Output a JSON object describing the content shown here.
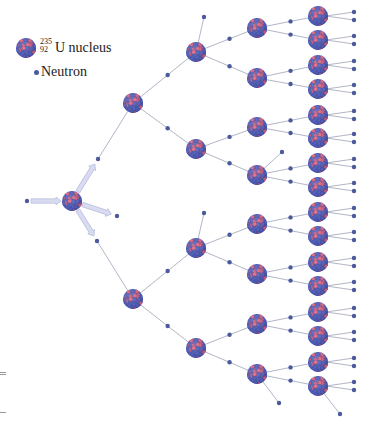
{
  "legend": {
    "nucleus_mass_number": "235",
    "nucleus_atomic_number": "92",
    "nucleus_label": "U nucleus",
    "neutron_label": "Neutron"
  },
  "colors": {
    "nucleus_red": "#e8607a",
    "nucleus_blue": "#4f5fc4",
    "neutron": "#4b5a9c",
    "link": "#9da3b8",
    "arrow_fill": "#d9dcf0",
    "arrow_stroke": "#a9afd6"
  },
  "diagram": {
    "nucleus_radius": 10,
    "neutron_radius": 2.2,
    "incoming_neutron": {
      "x": 27,
      "y": 201
    },
    "initial_nucleus": {
      "id": "N0",
      "x": 72,
      "y": 201
    },
    "initial_fission_neutrons": [
      {
        "x": 98,
        "y": 159
      },
      {
        "x": 117,
        "y": 216
      },
      {
        "x": 97,
        "y": 241
      }
    ],
    "nuclei": [
      {
        "id": "A1",
        "gen": 1,
        "x": 133,
        "y": 103
      },
      {
        "id": "A2",
        "gen": 1,
        "x": 133,
        "y": 299
      },
      {
        "id": "C1",
        "gen": 2,
        "x": 196,
        "y": 52
      },
      {
        "id": "C2",
        "gen": 2,
        "x": 196,
        "y": 149
      },
      {
        "id": "C3",
        "gen": 2,
        "x": 196,
        "y": 248
      },
      {
        "id": "C4",
        "gen": 2,
        "x": 196,
        "y": 348
      },
      {
        "id": "D1",
        "gen": 3,
        "x": 257,
        "y": 28
      },
      {
        "id": "D2",
        "gen": 3,
        "x": 257,
        "y": 78
      },
      {
        "id": "D3",
        "gen": 3,
        "x": 257,
        "y": 127
      },
      {
        "id": "D4",
        "gen": 3,
        "x": 257,
        "y": 175
      },
      {
        "id": "D5",
        "gen": 3,
        "x": 257,
        "y": 224
      },
      {
        "id": "D6",
        "gen": 3,
        "x": 257,
        "y": 274
      },
      {
        "id": "D7",
        "gen": 3,
        "x": 257,
        "y": 324
      },
      {
        "id": "D8",
        "gen": 3,
        "x": 257,
        "y": 374
      },
      {
        "id": "E1",
        "gen": 4,
        "x": 318,
        "y": 16
      },
      {
        "id": "E2",
        "gen": 4,
        "x": 318,
        "y": 40
      },
      {
        "id": "E3",
        "gen": 4,
        "x": 318,
        "y": 65
      },
      {
        "id": "E4",
        "gen": 4,
        "x": 318,
        "y": 89
      },
      {
        "id": "E5",
        "gen": 4,
        "x": 318,
        "y": 115
      },
      {
        "id": "E6",
        "gen": 4,
        "x": 318,
        "y": 138
      },
      {
        "id": "E7",
        "gen": 4,
        "x": 318,
        "y": 163
      },
      {
        "id": "E8",
        "gen": 4,
        "x": 318,
        "y": 187
      },
      {
        "id": "E9",
        "gen": 4,
        "x": 318,
        "y": 212
      },
      {
        "id": "E10",
        "gen": 4,
        "x": 318,
        "y": 236
      },
      {
        "id": "E11",
        "gen": 4,
        "x": 318,
        "y": 262
      },
      {
        "id": "E12",
        "gen": 4,
        "x": 318,
        "y": 286
      },
      {
        "id": "E13",
        "gen": 4,
        "x": 318,
        "y": 312
      },
      {
        "id": "E14",
        "gen": 4,
        "x": 318,
        "y": 336
      },
      {
        "id": "E15",
        "gen": 4,
        "x": 318,
        "y": 362
      },
      {
        "id": "E16",
        "gen": 4,
        "x": 318,
        "y": 386
      }
    ],
    "initial_links": [
      {
        "neutron": 0,
        "to": "A1"
      },
      {
        "neutron": 2,
        "to": "A2"
      }
    ],
    "reactions": [
      {
        "from": "A1",
        "to": "C1"
      },
      {
        "from": "A1",
        "to": "C2"
      },
      {
        "from": "A2",
        "to": "C3"
      },
      {
        "from": "A2",
        "to": "C4"
      },
      {
        "from": "C1",
        "to": "D1"
      },
      {
        "from": "C1",
        "to": "D2"
      },
      {
        "from": "C2",
        "to": "D3"
      },
      {
        "from": "C2",
        "to": "D4"
      },
      {
        "from": "C3",
        "to": "D5"
      },
      {
        "from": "C3",
        "to": "D6"
      },
      {
        "from": "C4",
        "to": "D7"
      },
      {
        "from": "C4",
        "to": "D8"
      },
      {
        "from": "D1",
        "to": "E1"
      },
      {
        "from": "D1",
        "to": "E2"
      },
      {
        "from": "D2",
        "to": "E3"
      },
      {
        "from": "D2",
        "to": "E4"
      },
      {
        "from": "D3",
        "to": "E5"
      },
      {
        "from": "D3",
        "to": "E6"
      },
      {
        "from": "D4",
        "to": "E7"
      },
      {
        "from": "D4",
        "to": "E8"
      },
      {
        "from": "D5",
        "to": "E9"
      },
      {
        "from": "D5",
        "to": "E10"
      },
      {
        "from": "D6",
        "to": "E11"
      },
      {
        "from": "D6",
        "to": "E12"
      },
      {
        "from": "D7",
        "to": "E13"
      },
      {
        "from": "D7",
        "to": "E14"
      },
      {
        "from": "D8",
        "to": "E15"
      },
      {
        "from": "D8",
        "to": "E16"
      }
    ],
    "neutron_fraction": 0.55,
    "stray_neutrons": [
      {
        "from": "C1",
        "x": 204,
        "y": 17
      },
      {
        "from": "C3",
        "x": 204,
        "y": 213
      },
      {
        "from": "D4",
        "x": 282,
        "y": 152
      },
      {
        "from": "D8",
        "x": 279,
        "y": 403
      },
      {
        "from": "E16",
        "x": 340,
        "y": 414
      }
    ],
    "end_neutron_x": 354,
    "end_neutron_offsets": [
      -4,
      4
    ]
  }
}
